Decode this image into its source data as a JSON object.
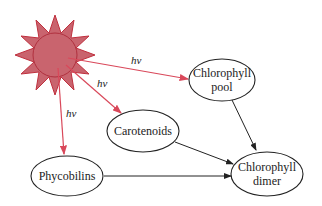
{
  "diagram": {
    "source": {
      "name": "sun",
      "label_light": "hv"
    },
    "nodes": {
      "chlorophyll_pool": {
        "line1": "Chlorophyll",
        "line2": "pool"
      },
      "carotenoids": {
        "line1": "Carotenoids"
      },
      "phycobilins": {
        "line1": "Phycobilins"
      },
      "chlorophyll_dimer": {
        "line1": "Chlorophyll",
        "line2": "dimer"
      }
    },
    "edge_labels": {
      "to_pool": "hν",
      "to_carotenoids": "hν",
      "to_phycobilins": "hν"
    },
    "colors": {
      "sun_fill": "#c9646e",
      "sun_stroke": "#c0303e",
      "light_arrow": "#d9485a",
      "transfer_arrow": "#222222"
    }
  }
}
